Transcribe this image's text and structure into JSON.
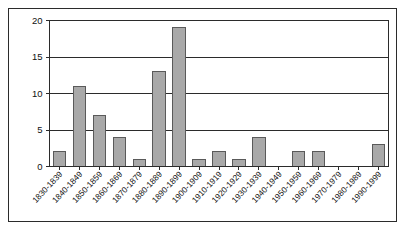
{
  "chart_data": {
    "type": "bar",
    "title": "",
    "subtitle": "",
    "xlabel": "",
    "ylabel": "",
    "categories": [
      "1830-1839",
      "1840-1849",
      "1850-1859",
      "1860-1869",
      "1870-1879",
      "1880-1889",
      "1890-1899",
      "1900-1909",
      "1910-1919",
      "1920-1929",
      "1930-1939",
      "1940-1949",
      "1950-1959",
      "1960-1969",
      "1970-1979",
      "1980-1989",
      "1990-1999"
    ],
    "values": [
      2,
      11,
      7,
      4,
      1,
      13,
      19,
      1,
      2,
      1,
      4,
      0,
      2,
      2,
      0,
      0,
      3
    ],
    "ylim": [
      0,
      20
    ],
    "ytick_labels": [
      "0",
      "5",
      "10",
      "15",
      "20"
    ],
    "ytick_values": [
      0,
      5,
      10,
      15,
      20
    ],
    "grid": true,
    "legend": false,
    "legend_position": "none",
    "colors": {
      "bar_fill": "#a9a9a9",
      "bar_stroke": "#5a5a5a",
      "gridline": "#2b2b2b",
      "axis": "#2b2b2b",
      "text": "#111111",
      "background": "#ffffff",
      "frame": "#2b2b2b"
    }
  }
}
